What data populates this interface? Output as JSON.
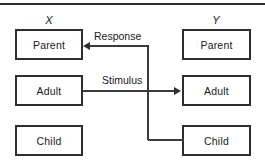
{
  "diagram": {
    "type": "transactional-analysis-crossed-transaction",
    "top_rule": true,
    "columns": [
      {
        "id": "x",
        "header": "X",
        "boxes": [
          {
            "id": "x-parent",
            "label": "Parent"
          },
          {
            "id": "x-adult",
            "label": "Adult"
          },
          {
            "id": "x-child",
            "label": "Child"
          }
        ]
      },
      {
        "id": "y",
        "header": "Y",
        "boxes": [
          {
            "id": "y-parent",
            "label": "Parent"
          },
          {
            "id": "y-adult",
            "label": "Adult"
          },
          {
            "id": "y-child",
            "label": "Child"
          }
        ]
      }
    ],
    "connectors": [
      {
        "id": "stimulus",
        "label": "Stimulus",
        "from": "x-adult",
        "to": "y-adult",
        "direction": "right"
      },
      {
        "id": "response",
        "label": "Response",
        "from": "y-child",
        "to": "x-parent",
        "direction": "left"
      }
    ],
    "colors": {
      "line": "#3a3a3a",
      "box_border": "#2e2e2e",
      "text": "#1a1a1a",
      "background": "#ffffff"
    }
  }
}
